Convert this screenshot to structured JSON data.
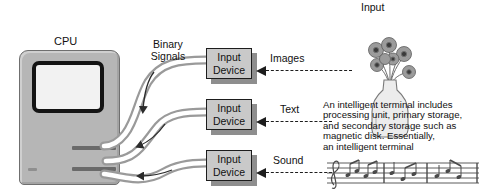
{
  "diagram": {
    "cpu": {
      "label": "CPU"
    },
    "binary_signals_label": "Binary\nSignals",
    "input_heading": "Input",
    "devices": [
      {
        "name": "images-device",
        "line1": "Input",
        "line2": "Device",
        "signal": "Images"
      },
      {
        "name": "text-device",
        "line1": "Input",
        "line2": "Device",
        "signal": "Text"
      },
      {
        "name": "sound-device",
        "line1": "Input",
        "line2": "Device",
        "signal": "Sound"
      }
    ],
    "description": "An intelligent terminal includes\nprocessing unit, primary storage,\nand secondary storage such as\nmagnetic disk.  Essentially,\nan intelligent terminal",
    "illustrations": {
      "vase_alt": "vase-of-flowers-illustration",
      "music_alt": "musical-staff-notation"
    },
    "colors": {
      "cpu_body": "#b6b6b6",
      "cpu_screen": "#f2f2f2",
      "device_box": "#c9c9c9",
      "device_shadow": "#8e8e8e",
      "outline": "#1d1d1d",
      "band": "#9a9a9a",
      "background": "#ffffff"
    }
  }
}
